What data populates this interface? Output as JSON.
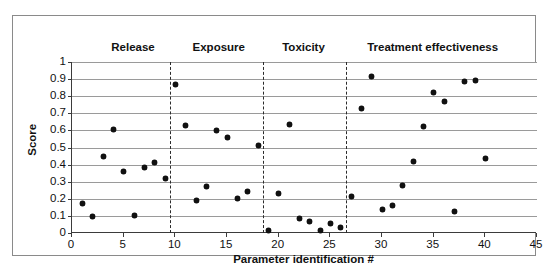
{
  "chart_data": {
    "type": "scatter",
    "title": "",
    "xlabel": "Parameter identification #",
    "ylabel": "Score",
    "xlim": [
      0,
      45
    ],
    "ylim": [
      0,
      1
    ],
    "xticks": [
      0,
      5,
      10,
      15,
      20,
      25,
      30,
      35,
      40,
      45
    ],
    "ytick_labels": [
      "1",
      "0.9",
      "0.8",
      "0.7",
      "0.6",
      "0.5",
      "0.4",
      "0.3",
      "0.2",
      "0.1",
      "0"
    ],
    "yticks": [
      1,
      0.9,
      0.8,
      0.7,
      0.6,
      0.5,
      0.4,
      0.3,
      0.2,
      0.1,
      0
    ],
    "grid": "horizontal",
    "legend": "none",
    "marker": "diamond-filled",
    "marker_color": "#111111",
    "x": [
      1,
      2,
      3,
      4,
      5,
      6,
      7,
      8,
      9,
      10,
      11,
      12,
      13,
      14,
      15,
      16,
      17,
      18,
      19,
      20,
      21,
      22,
      23,
      24,
      25,
      26,
      27,
      28,
      29,
      30,
      31,
      32,
      33,
      34,
      35,
      36,
      37,
      38,
      39,
      40
    ],
    "values": [
      0.17,
      0.095,
      0.45,
      0.605,
      0.36,
      0.1,
      0.385,
      0.41,
      0.32,
      0.87,
      0.63,
      0.19,
      0.27,
      0.6,
      0.56,
      0.2,
      0.24,
      0.51,
      0.015,
      0.23,
      0.635,
      0.085,
      0.07,
      0.015,
      0.055,
      0.03,
      0.215,
      0.73,
      0.915,
      0.14,
      0.16,
      0.28,
      0.42,
      0.62,
      0.82,
      0.77,
      0.125,
      0.885,
      0.89,
      0.435
    ],
    "sections": [
      {
        "label": "Release",
        "start": 0,
        "end": 9.5,
        "label_x": 6.0
      },
      {
        "label": "Exposure",
        "start": 9.5,
        "end": 18.5,
        "label_x": 14.3
      },
      {
        "label": "Toxicity",
        "start": 18.5,
        "end": 26.5,
        "label_x": 22.5
      },
      {
        "label": "Treatment effectiveness",
        "start": 26.5,
        "end": 45,
        "label_x": 35.0
      }
    ],
    "dividers": [
      9.5,
      18.5,
      26.5
    ],
    "divider_style": "dashed"
  }
}
